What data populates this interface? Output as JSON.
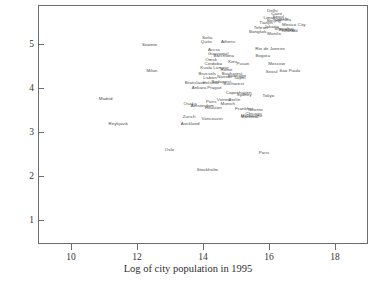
{
  "chart_data": {
    "type": "scatter",
    "title": "",
    "xlabel": "Log of city population in 1995",
    "ylabel": "",
    "xlim": [
      9,
      19
    ],
    "ylim": [
      0.45,
      5.9
    ],
    "grid": false,
    "legend": "none",
    "marker_style": "text-label",
    "xticks": [
      10,
      12,
      14,
      16,
      18
    ],
    "yticks": [
      1,
      2,
      3,
      4,
      5
    ],
    "point_label_field": "city",
    "points": [
      {
        "city": "Delhi",
        "x": 16.07,
        "y": 5.79
      },
      {
        "city": "Cairo",
        "x": 16.2,
        "y": 5.72
      },
      {
        "city": "Seoul",
        "x": 16.25,
        "y": 5.66
      },
      {
        "city": "Lima",
        "x": 15.95,
        "y": 5.62
      },
      {
        "city": "Karachi",
        "x": 16.33,
        "y": 5.6
      },
      {
        "city": "Beijing",
        "x": 16.12,
        "y": 5.56
      },
      {
        "city": "Calcutta",
        "x": 16.38,
        "y": 5.58
      },
      {
        "city": "Tianjin",
        "x": 15.88,
        "y": 5.52
      },
      {
        "city": "Mexico City",
        "x": 16.72,
        "y": 5.47
      },
      {
        "city": "Jakarta",
        "x": 16.05,
        "y": 5.41
      },
      {
        "city": "Shanghai",
        "x": 16.42,
        "y": 5.38
      },
      {
        "city": "Tehran",
        "x": 15.72,
        "y": 5.4
      },
      {
        "city": "Bombay",
        "x": 16.52,
        "y": 5.35
      },
      {
        "city": "Istanbul",
        "x": 16.6,
        "y": 5.33
      },
      {
        "city": "Bangkok",
        "x": 15.63,
        "y": 5.31
      },
      {
        "city": "Manila",
        "x": 16.12,
        "y": 5.26
      },
      {
        "city": "Sofia",
        "x": 14.1,
        "y": 5.18
      },
      {
        "city": "Quito",
        "x": 14.07,
        "y": 5.09
      },
      {
        "city": "Athens",
        "x": 14.73,
        "y": 5.08
      },
      {
        "city": "Soweto",
        "x": 12.35,
        "y": 5.0
      },
      {
        "city": "Rio de Janeiro",
        "x": 16.0,
        "y": 4.93
      },
      {
        "city": "Accra",
        "x": 14.3,
        "y": 4.9
      },
      {
        "city": "Guayaquil",
        "x": 14.43,
        "y": 4.8
      },
      {
        "city": "Barcelona",
        "x": 14.6,
        "y": 4.76
      },
      {
        "city": "Bogota",
        "x": 15.78,
        "y": 4.76
      },
      {
        "city": "Omsk",
        "x": 14.22,
        "y": 4.66
      },
      {
        "city": "Kiev",
        "x": 14.87,
        "y": 4.63
      },
      {
        "city": "Cordoba",
        "x": 14.28,
        "y": 4.58
      },
      {
        "city": "Pusan",
        "x": 15.18,
        "y": 4.58
      },
      {
        "city": "Moscow",
        "x": 16.2,
        "y": 4.58
      },
      {
        "city": "Milan",
        "x": 12.42,
        "y": 4.42
      },
      {
        "city": "Kuala Lumpur",
        "x": 14.32,
        "y": 4.48
      },
      {
        "city": "Rome",
        "x": 14.68,
        "y": 4.45
      },
      {
        "city": "Seoul",
        "x": 16.05,
        "y": 4.4
      },
      {
        "city": "Sao Paulo",
        "x": 16.6,
        "y": 4.42
      },
      {
        "city": "Brussels",
        "x": 14.1,
        "y": 4.36
      },
      {
        "city": "Bucharest",
        "x": 14.85,
        "y": 4.36
      },
      {
        "city": "Santiago",
        "x": 15.0,
        "y": 4.3
      },
      {
        "city": "Nairobi",
        "x": 14.62,
        "y": 4.28
      },
      {
        "city": "Lisbon",
        "x": 14.18,
        "y": 4.26
      },
      {
        "city": "Taipei",
        "x": 15.08,
        "y": 4.26
      },
      {
        "city": "Bratislava",
        "x": 13.72,
        "y": 4.14
      },
      {
        "city": "Helsinki",
        "x": 14.2,
        "y": 4.14
      },
      {
        "city": "Budapest",
        "x": 14.52,
        "y": 4.16
      },
      {
        "city": "Bucharest",
        "x": 14.9,
        "y": 4.12
      },
      {
        "city": "Ankara",
        "x": 13.85,
        "y": 4.02
      },
      {
        "city": "Prague",
        "x": 14.32,
        "y": 4.03
      },
      {
        "city": "Madrid",
        "x": 11.02,
        "y": 3.78
      },
      {
        "city": "Copenhagen",
        "x": 15.05,
        "y": 3.92
      },
      {
        "city": "Sydney",
        "x": 15.22,
        "y": 3.86
      },
      {
        "city": "Tokyo",
        "x": 15.95,
        "y": 3.84
      },
      {
        "city": "Vienna",
        "x": 14.6,
        "y": 3.76
      },
      {
        "city": "Berlin",
        "x": 14.92,
        "y": 3.76
      },
      {
        "city": "Paris",
        "x": 14.22,
        "y": 3.72
      },
      {
        "city": "Osaka",
        "x": 13.58,
        "y": 3.66
      },
      {
        "city": "Amsterdam",
        "x": 13.95,
        "y": 3.62
      },
      {
        "city": "Munich",
        "x": 14.72,
        "y": 3.66
      },
      {
        "city": "Houston",
        "x": 14.28,
        "y": 3.58
      },
      {
        "city": "Frankfurt",
        "x": 15.22,
        "y": 3.54
      },
      {
        "city": "Toronto",
        "x": 15.55,
        "y": 3.52
      },
      {
        "city": "Chicago",
        "x": 15.5,
        "y": 3.44
      },
      {
        "city": "Melbourne",
        "x": 15.45,
        "y": 3.4
      },
      {
        "city": "Montreal",
        "x": 15.38,
        "y": 3.36
      },
      {
        "city": "Zurich",
        "x": 13.55,
        "y": 3.36
      },
      {
        "city": "Vancouver",
        "x": 14.25,
        "y": 3.32
      },
      {
        "city": "Reykjavik",
        "x": 11.4,
        "y": 3.2
      },
      {
        "city": "Auckland",
        "x": 13.58,
        "y": 3.22
      },
      {
        "city": "Oslo",
        "x": 12.95,
        "y": 2.62
      },
      {
        "city": "Paris",
        "x": 15.82,
        "y": 2.55
      },
      {
        "city": "Stockholm",
        "x": 14.1,
        "y": 2.15
      }
    ]
  }
}
